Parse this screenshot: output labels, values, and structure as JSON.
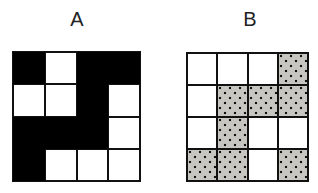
{
  "figure": {
    "panels": [
      {
        "label": "A",
        "fill_style": "solid-black",
        "rows": [
          [
            "black",
            "white",
            "black",
            "black"
          ],
          [
            "white",
            "white",
            "black",
            "white"
          ],
          [
            "black",
            "black",
            "black",
            "white"
          ],
          [
            "black",
            "white",
            "white",
            "white"
          ]
        ]
      },
      {
        "label": "B",
        "fill_style": "dotted-gray",
        "rows": [
          [
            "white",
            "white",
            "white",
            "dotted"
          ],
          [
            "white",
            "dotted",
            "dotted",
            "dotted"
          ],
          [
            "white",
            "dotted",
            "white",
            "white"
          ],
          [
            "dotted",
            "dotted",
            "white",
            "dotted"
          ]
        ]
      }
    ],
    "colors": {
      "black_fill": "#000000",
      "dotted_fill": "#c8c6c0",
      "dot": "#111111",
      "grid_line": "#111111",
      "background": "#ffffff"
    }
  }
}
